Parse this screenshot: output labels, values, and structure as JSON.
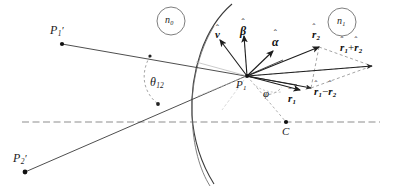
{
  "figure": {
    "type": "optics-refraction-geometry-diagram",
    "background_color": "#ffffff",
    "stroke_color": "#2b2b2b",
    "dashed_color": "#8d8d8d"
  },
  "points": [
    {
      "id": "P1prime",
      "base": "P",
      "sub": "1",
      "prime": "′",
      "label": "P′₁",
      "x": 62,
      "y": 44,
      "label_x": 50,
      "label_y": 24
    },
    {
      "id": "P2prime",
      "base": "P",
      "sub": "2",
      "prime": "′",
      "label": "P′₂",
      "x": 25,
      "y": 172,
      "label_x": 13,
      "label_y": 152
    },
    {
      "id": "P1",
      "base": "P",
      "sub": "1",
      "prime": "",
      "label": "P₁",
      "x": 247,
      "y": 76,
      "label_x": 236,
      "label_y": 79
    },
    {
      "id": "C",
      "base": "C",
      "sub": "",
      "prime": "",
      "label": "C",
      "x": 286,
      "y": 122,
      "label_x": 282,
      "label_y": 126
    }
  ],
  "media_labels": [
    {
      "id": "n0",
      "base": "n",
      "sub": "0",
      "cx": 171,
      "cy": 21,
      "r": 14
    },
    {
      "id": "n1",
      "base": "n",
      "sub": "1",
      "cx": 342,
      "cy": 22,
      "r": 14
    }
  ],
  "angles": [
    {
      "id": "theta12",
      "symbol": "θ",
      "sub": "12",
      "label_x": 150,
      "label_y": 76
    },
    {
      "id": "phi",
      "symbol": "φ",
      "sub": "",
      "label_x": 263,
      "label_y": 88
    }
  ],
  "vectors": [
    {
      "id": "v",
      "symbol": "v",
      "sub": "",
      "hat": "ˆ",
      "kind": "single",
      "from_x": 247,
      "from_y": 76,
      "to_x": 220,
      "to_y": 40,
      "label_x": 215,
      "label_y": 29
    },
    {
      "id": "beta",
      "symbol": "β",
      "sub": "",
      "hat": "ˆ",
      "kind": "single",
      "from_x": 247,
      "from_y": 76,
      "to_x": 244,
      "to_y": 36,
      "label_x": 240,
      "label_y": 25
    },
    {
      "id": "alpha",
      "symbol": "α",
      "sub": "",
      "hat": "ˆ",
      "kind": "single",
      "from_x": 247,
      "from_y": 76,
      "to_x": 273,
      "to_y": 51,
      "label_x": 272,
      "label_y": 36
    },
    {
      "id": "r2",
      "symbol": "r",
      "sub": "2",
      "hat": "ˆ",
      "kind": "single",
      "from_x": 247,
      "from_y": 76,
      "to_x": 319,
      "to_y": 47,
      "label_x": 312,
      "label_y": 29
    },
    {
      "id": "r1",
      "symbol": "r",
      "sub": "1",
      "hat": "ˆ",
      "kind": "single",
      "from_x": 247,
      "from_y": 76,
      "to_x": 300,
      "to_y": 90,
      "label_x": 288,
      "label_y": 93
    },
    {
      "id": "r1plusr2",
      "symbol": "r",
      "sub": "1",
      "hat": "ˆ",
      "kind": "sum",
      "op": "+",
      "symbol2": "r",
      "sub2": "2",
      "from_x": 247,
      "from_y": 76,
      "to_x": 372,
      "to_y": 66,
      "label_x": 340,
      "label_y": 42
    },
    {
      "id": "r1minusr2",
      "symbol": "r",
      "sub": "1",
      "hat": "ˆ",
      "kind": "diff",
      "op": "−",
      "symbol2": "r",
      "sub2": "2",
      "from_x": 247,
      "from_y": 76,
      "to_x": 311,
      "to_y": 88,
      "label_x": 314,
      "label_y": 92
    }
  ],
  "rays": [
    {
      "id": "ray-from-P1prime",
      "style": "solid",
      "from_x": 62,
      "from_y": 44,
      "to_x": 247,
      "to_y": 76
    },
    {
      "id": "ray-from-P2prime",
      "style": "solid",
      "from_x": 25,
      "from_y": 172,
      "to_x": 247,
      "to_y": 76
    }
  ],
  "axis": {
    "id": "optical-axis",
    "style": "dashed",
    "from_x": 22,
    "from_y": 122,
    "to_x": 380,
    "to_y": 122
  },
  "surfaces": [
    {
      "id": "refracting-surface-outer",
      "style": "solid"
    },
    {
      "id": "refracting-surface-inner",
      "style": "solid"
    }
  ]
}
